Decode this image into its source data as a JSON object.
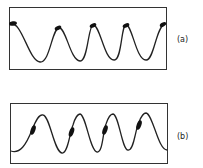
{
  "panels": [
    {
      "id": "a",
      "label": "(a)",
      "description": "sinusoidal wave with blobs at the crests"
    },
    {
      "id": "b",
      "label": "(b)",
      "description": "sinusoidal wave with blobs on the rising slopes"
    }
  ],
  "colors": {
    "stroke": "#222222",
    "background": "#ffffff"
  }
}
